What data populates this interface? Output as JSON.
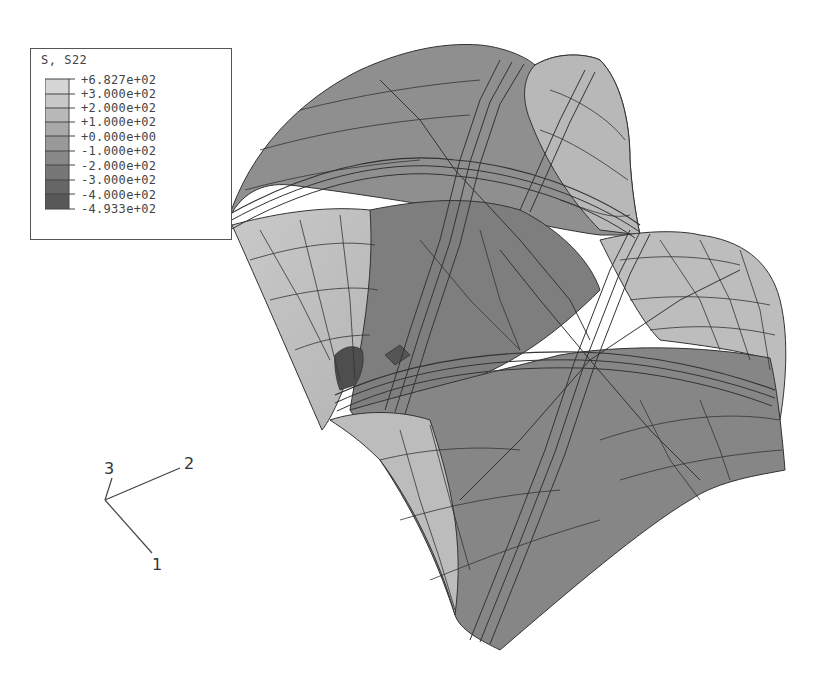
{
  "legend": {
    "title": "S, S22",
    "levels": [
      {
        "label": "+6.827e+02",
        "color": "#d6d6d6"
      },
      {
        "label": "+3.000e+02",
        "color": "#c8c8c8"
      },
      {
        "label": "+2.000e+02",
        "color": "#b9b9b9"
      },
      {
        "label": "+1.000e+02",
        "color": "#a9a9a9"
      },
      {
        "label": "+0.000e+00",
        "color": "#999999"
      },
      {
        "label": "-1.000e+02",
        "color": "#888888"
      },
      {
        "label": "-2.000e+02",
        "color": "#777777"
      },
      {
        "label": "-3.000e+02",
        "color": "#666666"
      },
      {
        "label": "-4.000e+02",
        "color": "#585858"
      },
      {
        "label": "-4.933e+02",
        "color": ""
      }
    ]
  },
  "triad": {
    "axis_1": "1",
    "axis_2": "2",
    "axis_3": "3"
  },
  "model": {
    "description": "Deformed shell mesh contour plot of S22 stress (two-bay groin vault)"
  }
}
